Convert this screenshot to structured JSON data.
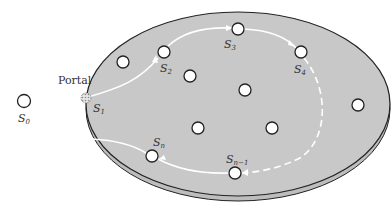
{
  "diagram": {
    "type": "state-path-on-disc",
    "colors": {
      "disc_fill": "#c8c8c8",
      "disc_edge": "#222222",
      "rim_fill": "#bdbdbd",
      "path": "#ffffff",
      "node_fill": "#ffffff",
      "node_stroke": "#222222",
      "portal_fill": "#d8d8d8"
    },
    "labels": {
      "portal": "Portal",
      "s0": "S",
      "s0_sub": "0",
      "s1": "S",
      "s1_sub": "1",
      "s2": "S",
      "s2_sub": "2",
      "s3": "S",
      "s3_sub": "3",
      "s4": "S",
      "s4_sub": "4",
      "sn": "S",
      "sn_sub": "n",
      "sn1": "S",
      "sn1_sub": "n−1"
    },
    "nodes": [
      {
        "id": "S0",
        "x": 24,
        "y": 101,
        "labeled": true
      },
      {
        "id": "S1-portal",
        "x": 86,
        "y": 98,
        "labeled": true
      },
      {
        "id": "u1",
        "x": 123,
        "y": 62,
        "labeled": false
      },
      {
        "id": "S2",
        "x": 164,
        "y": 52,
        "labeled": true
      },
      {
        "id": "S3",
        "x": 238,
        "y": 29,
        "labeled": true
      },
      {
        "id": "S4",
        "x": 301,
        "y": 52,
        "labeled": true
      },
      {
        "id": "u2",
        "x": 190,
        "y": 76,
        "labeled": false
      },
      {
        "id": "u3",
        "x": 245,
        "y": 90,
        "labeled": false
      },
      {
        "id": "u4",
        "x": 358,
        "y": 105,
        "labeled": false
      },
      {
        "id": "u5",
        "x": 198,
        "y": 128,
        "labeled": false
      },
      {
        "id": "u6",
        "x": 272,
        "y": 128,
        "labeled": false
      },
      {
        "id": "Sn",
        "x": 152,
        "y": 156,
        "labeled": true
      },
      {
        "id": "Sn-1",
        "x": 235,
        "y": 173,
        "labeled": true
      }
    ],
    "path_sequence": [
      "S1",
      "S2",
      "S3",
      "S4",
      "...",
      "Sn-1",
      "Sn",
      "S1"
    ]
  }
}
